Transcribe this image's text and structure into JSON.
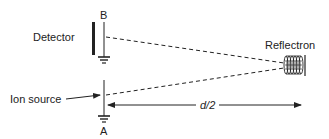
{
  "diagram": {
    "labels": {
      "point_b": "B",
      "point_a": "A",
      "detector": "Detector",
      "ion_source": "Ion source",
      "reflectron": "Reflectron",
      "distance": "d/2"
    },
    "colors": {
      "ink": "#222222",
      "background": "#ffffff"
    }
  }
}
